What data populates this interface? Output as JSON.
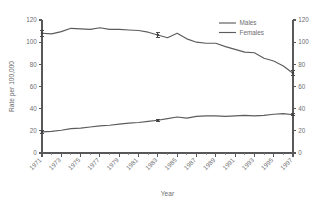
{
  "chart_data": {
    "type": "line",
    "title": "",
    "xlabel": "Year",
    "ylabel": "Rate per 100,000",
    "ylim": [
      0,
      120
    ],
    "xlim": [
      1971,
      1997
    ],
    "grid": false,
    "legend_position": "top-right",
    "y_ticks": [
      "0",
      "20",
      "40",
      "60",
      "80",
      "100",
      "120"
    ],
    "y_ticks_right": [
      "0",
      "20",
      "40",
      "60",
      "80",
      "100",
      "120"
    ],
    "x_ticks": [
      "1971",
      "1973",
      "1975",
      "1977",
      "1979",
      "1981",
      "1983",
      "1985",
      "1987",
      "1989",
      "1991",
      "1993",
      "1995",
      "1997"
    ],
    "x_all_years": [
      1971,
      1972,
      1973,
      1974,
      1975,
      1976,
      1977,
      1978,
      1979,
      1980,
      1981,
      1982,
      1983,
      1984,
      1985,
      1986,
      1987,
      1988,
      1989,
      1990,
      1991,
      1992,
      1993,
      1994,
      1995,
      1996,
      1997
    ],
    "series": [
      {
        "name": "Males",
        "values": [
          108.0,
          107.5,
          109.5,
          112.5,
          112.0,
          111.5,
          113.0,
          111.5,
          111.5,
          111.0,
          110.5,
          109.0,
          106.5,
          104.0,
          108.0,
          103.0,
          100.0,
          99.0,
          99.0,
          96.0,
          93.5,
          91.0,
          90.5,
          85.5,
          83.0,
          78.5,
          72.0
        ],
        "error_bars": [
          {
            "year": 1971,
            "value": 108.0,
            "low": 105.5,
            "high": 110.5
          },
          {
            "year": 1983,
            "value": 106.5,
            "low": 104.5,
            "high": 108.5
          },
          {
            "year": 1997,
            "value": 72.0,
            "low": 70.0,
            "high": 74.5
          }
        ]
      },
      {
        "name": "Females",
        "values": [
          19.0,
          19.5,
          20.5,
          22.0,
          22.5,
          23.5,
          24.5,
          25.0,
          26.0,
          27.0,
          27.5,
          28.5,
          29.5,
          31.0,
          32.5,
          31.5,
          33.0,
          33.5,
          33.5,
          33.0,
          33.5,
          34.0,
          33.5,
          34.0,
          35.0,
          35.5,
          34.5
        ],
        "error_bars": [
          {
            "year": 1971,
            "value": 19.0,
            "low": 17.5,
            "high": 20.5
          },
          {
            "year": 1983,
            "value": 29.5,
            "low": 28.5,
            "high": 30.5
          },
          {
            "year": 1997,
            "value": 34.5,
            "low": 33.5,
            "high": 36.0
          }
        ]
      }
    ],
    "legend": [
      "Males",
      "Females"
    ],
    "colors": {
      "series_line": "#5c5c5e",
      "axis": "#58585a",
      "text": "#6d6d70",
      "background": "#ffffff"
    }
  }
}
